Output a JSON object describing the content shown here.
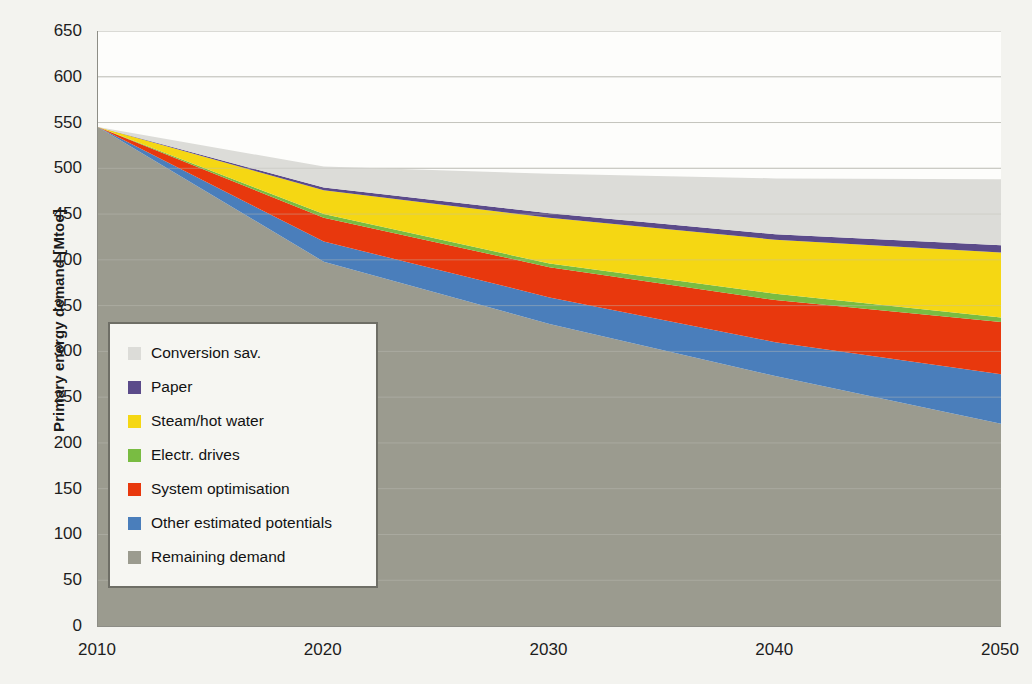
{
  "chart_data": {
    "type": "area",
    "stacked": true,
    "title": "",
    "subtitle": "",
    "xlabel": "",
    "ylabel": "Primary energy demand [Mtoe]",
    "x": [
      2010,
      2020,
      2030,
      2040,
      2050
    ],
    "xticklabels": [
      "2010",
      "2020",
      "2030",
      "2040",
      "2050"
    ],
    "xlim": [
      2010,
      2050
    ],
    "ylim": [
      0,
      650
    ],
    "yticks": [
      0,
      50,
      100,
      150,
      200,
      250,
      300,
      350,
      400,
      450,
      500,
      550,
      600,
      650
    ],
    "yticklabels": [
      "0",
      "50",
      "100",
      "150",
      "200",
      "250",
      "300",
      "350",
      "400",
      "450",
      "500",
      "550",
      "600",
      "650"
    ],
    "grid": "horizontal",
    "legend_position": "inside-left",
    "series": [
      {
        "name": "Remaining demand",
        "color": "#9b9b8f",
        "values": [
          545,
          398,
          330,
          273,
          221
        ]
      },
      {
        "name": "Other estimated potentials",
        "color": "#4a7ebb",
        "values": [
          0,
          22,
          29,
          37,
          54
        ]
      },
      {
        "name": "System optimisation",
        "color": "#e8380d",
        "values": [
          0,
          26,
          33,
          46,
          57
        ]
      },
      {
        "name": "Electr. drives",
        "color": "#79bc42",
        "values": [
          0,
          4,
          4,
          7,
          5
        ]
      },
      {
        "name": "Steam/hot water",
        "color": "#f5d713",
        "values": [
          0,
          26,
          50,
          59,
          71
        ]
      },
      {
        "name": "Paper",
        "color": "#5b4b8a",
        "values": [
          0,
          3,
          5,
          6,
          8
        ]
      },
      {
        "name": "Conversion sav.",
        "color": "#dcdcd8",
        "values": [
          0,
          23,
          43,
          61,
          72
        ]
      }
    ],
    "cumulative_tops": {
      "remaining_demand": [
        545,
        398,
        330,
        273,
        221
      ],
      "other_estimated": [
        545,
        420,
        359,
        310,
        275
      ],
      "system_optimisation": [
        545,
        446,
        392,
        356,
        332
      ],
      "electr_drives": [
        545,
        450,
        396,
        363,
        337
      ],
      "steam_hot_water": [
        545,
        476,
        446,
        422,
        408
      ],
      "paper": [
        545,
        479,
        451,
        428,
        416
      ],
      "conversion_sav": [
        545,
        502,
        494,
        489,
        488
      ],
      "total_reference_demand": [
        545,
        502,
        494,
        489,
        593
      ]
    },
    "annotations": []
  },
  "legend": {
    "items": [
      {
        "label": "Conversion sav.",
        "color": "#dcdcd8"
      },
      {
        "label": "Paper",
        "color": "#5b4b8a"
      },
      {
        "label": "Steam/hot water",
        "color": "#f5d713"
      },
      {
        "label": "Electr. drives",
        "color": "#79bc42"
      },
      {
        "label": "System optimisation",
        "color": "#e8380d"
      },
      {
        "label": "Other estimated potentials",
        "color": "#4a7ebb"
      },
      {
        "label": "Remaining demand",
        "color": "#9b9b8f"
      }
    ]
  },
  "colors": {
    "plot_background": "#fdfdfb",
    "page_background": "#f3f3ef",
    "gridline": "#c9c9c2",
    "axis_line": "#8d8d86",
    "legend_border": "#6e6e66",
    "legend_background": "#f6f6f2",
    "text": "#1d1d1d"
  }
}
